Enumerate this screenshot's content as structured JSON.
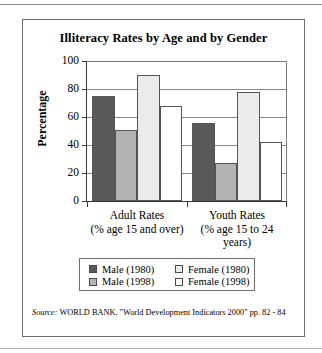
{
  "chart_data": {
    "type": "bar",
    "title": "Illiteracy Rates by Age and by Gender",
    "xlabel": "",
    "ylabel": "Percentage",
    "ylim": [
      0,
      100
    ],
    "yticks": [
      0,
      20,
      40,
      60,
      80,
      100
    ],
    "grid": true,
    "legend_position": "bottom",
    "categories": [
      "Adult Rates",
      "Youth Rates"
    ],
    "category_sublabels": [
      "(% age 15 and over)",
      "(% age 15 to 24 years)"
    ],
    "series": [
      {
        "name": "Male (1980)",
        "color": "#595959",
        "values": [
          75,
          56
        ]
      },
      {
        "name": "Male (1998)",
        "color": "#b3b3b3",
        "values": [
          51,
          27
        ]
      },
      {
        "name": "Female (1980)",
        "color": "#ebebeb",
        "values": [
          90,
          78
        ]
      },
      {
        "name": "Female (1998)",
        "color": "#ffffff",
        "values": [
          68,
          42
        ]
      }
    ],
    "legend_order": [
      "Male (1980)",
      "Female (1980)",
      "Male (1998)",
      "Female (1998)"
    ],
    "source": {
      "prefix": "Source:",
      "text": "WORLD BANK, \"World Development Indicators 2000\" pp. 82 - 84"
    }
  },
  "axis": {
    "tick_0": "0",
    "tick_20": "20",
    "tick_40": "40",
    "tick_60": "60",
    "tick_80": "80",
    "tick_100": "100"
  },
  "groups": [
    {
      "label": "Adult Rates",
      "sublabel": "(% age 15 and over)"
    },
    {
      "label": "Youth Rates",
      "sublabel": "(% age 15 to 24 years)"
    }
  ],
  "legend": {
    "row1": [
      {
        "label": "Male (1980)",
        "color": "#595959"
      },
      {
        "label": "Female (1980)",
        "color": "#ebebeb"
      }
    ],
    "row2": [
      {
        "label": "Male (1998)",
        "color": "#b3b3b3"
      },
      {
        "label": "Female (1998)",
        "color": "#ffffff"
      }
    ]
  }
}
